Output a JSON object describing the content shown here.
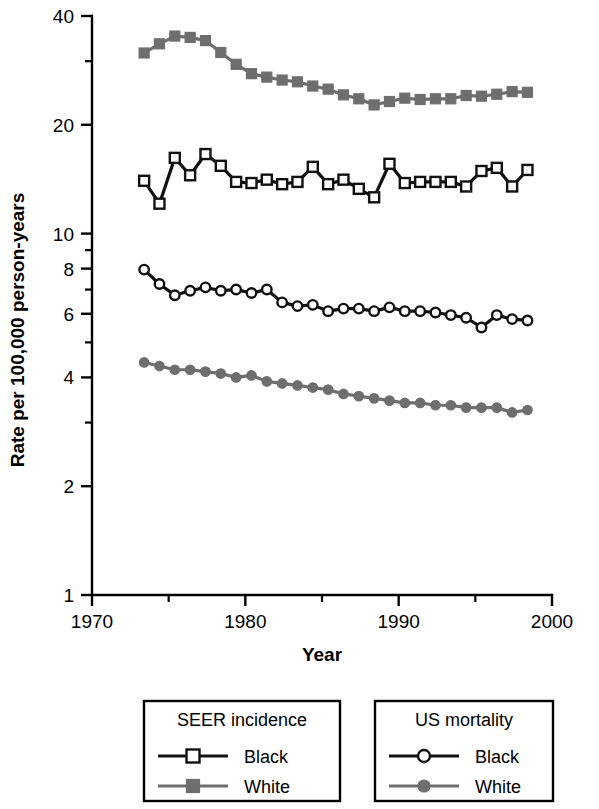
{
  "chart_data": {
    "type": "line",
    "title": "",
    "xlabel": "Year",
    "ylabel": "Rate per 100,000 person-years",
    "yscale": "log",
    "ylim": [
      1,
      40
    ],
    "xlim": [
      1970,
      2000
    ],
    "grid": false,
    "legend_position": "below-plot",
    "x_ticks": [
      1970,
      1980,
      1990,
      2000
    ],
    "x_tick_labels": [
      "1970",
      "1980",
      "1990",
      "2000"
    ],
    "x_minor_ticks": [
      1975,
      1985,
      1995
    ],
    "y_ticks": [
      40,
      20,
      10,
      8,
      6,
      4,
      2,
      1
    ],
    "y_tick_labels": [
      "40",
      "20",
      "10",
      "8",
      "6",
      "4",
      "2",
      "1"
    ],
    "y_minor_ticks": [
      30,
      9,
      7,
      5,
      3
    ],
    "x": [
      1973.4,
      1974.4,
      1975.4,
      1976.4,
      1977.4,
      1978.4,
      1979.4,
      1980.4,
      1981.4,
      1982.4,
      1983.4,
      1984.4,
      1985.4,
      1986.4,
      1987.4,
      1988.4,
      1989.4,
      1990.4,
      1991.4,
      1992.4,
      1993.4,
      1994.4,
      1995.4,
      1996.4,
      1997.4,
      1998.4
    ],
    "series": [
      {
        "name": "SEER incidence White",
        "marker": "filled-square",
        "color": "#6e6e6e",
        "values": [
          31.6,
          33.5,
          35.2,
          34.9,
          34.2,
          31.7,
          29.4,
          27.7,
          27.1,
          26.6,
          26.3,
          25.6,
          25.1,
          24.2,
          23.6,
          22.7,
          23.2,
          23.7,
          23.5,
          23.6,
          23.6,
          24.1,
          24.0,
          24.3,
          24.7,
          24.6
        ]
      },
      {
        "name": "SEER incidence Black",
        "marker": "open-square",
        "color": "#111111",
        "values": [
          14.0,
          12.1,
          16.2,
          14.5,
          16.6,
          15.4,
          13.9,
          13.8,
          14.1,
          13.7,
          13.9,
          15.3,
          13.7,
          14.1,
          13.3,
          12.6,
          15.6,
          13.8,
          13.9,
          13.9,
          13.9,
          13.5,
          14.9,
          15.2,
          13.5,
          15.0
        ]
      },
      {
        "name": "US mortality Black",
        "marker": "open-circle",
        "color": "#111111",
        "values": [
          7.95,
          7.25,
          6.75,
          6.95,
          7.1,
          6.95,
          7.0,
          6.85,
          7.0,
          6.45,
          6.3,
          6.35,
          6.1,
          6.2,
          6.2,
          6.1,
          6.25,
          6.1,
          6.1,
          6.05,
          5.95,
          5.85,
          5.5,
          5.95,
          5.8,
          5.75
        ]
      },
      {
        "name": "US mortality White",
        "marker": "filled-circle",
        "color": "#6e6e6e",
        "values": [
          4.4,
          4.3,
          4.2,
          4.2,
          4.15,
          4.1,
          4.0,
          4.05,
          3.9,
          3.85,
          3.8,
          3.75,
          3.7,
          3.6,
          3.55,
          3.5,
          3.45,
          3.4,
          3.4,
          3.35,
          3.35,
          3.3,
          3.3,
          3.3,
          3.2,
          3.25
        ]
      }
    ]
  },
  "legends": [
    {
      "id": "seer-incidence",
      "title": "SEER incidence",
      "entries": [
        {
          "label": "Black",
          "marker": "open-square",
          "color": "#111111"
        },
        {
          "label": "White",
          "marker": "filled-square",
          "color": "#6e6e6e"
        }
      ]
    },
    {
      "id": "us-mortality",
      "title": "US mortality",
      "entries": [
        {
          "label": "Black",
          "marker": "open-circle",
          "color": "#111111"
        },
        {
          "label": "White",
          "marker": "filled-circle",
          "color": "#6e6e6e"
        }
      ]
    }
  ],
  "colors": {
    "black_series": "#111111",
    "gray_series": "#6e6e6e",
    "axis": "#000000",
    "background": "#ffffff"
  }
}
